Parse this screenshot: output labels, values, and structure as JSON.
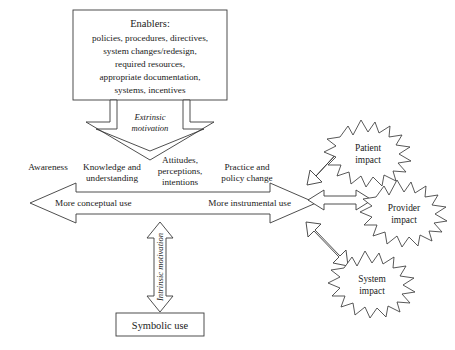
{
  "diagram": {
    "background_color": "#ffffff",
    "line_color": "#3b3b3b",
    "text_color": "#1a1a1a"
  },
  "enablers_box": {
    "heading": "Enablers:",
    "lines": [
      "policies, procedures, directives,",
      "system changes/redesign,",
      "required resources,",
      "appropriate documentation,",
      "systems, incentives"
    ]
  },
  "extrinsic_arrow": {
    "line1": "Extrinsic",
    "line2": "motivation"
  },
  "continuum_labels": [
    {
      "key": "awareness",
      "lines": [
        "Awareness"
      ]
    },
    {
      "key": "knowledge",
      "lines": [
        "Knowledge and",
        "understanding"
      ]
    },
    {
      "key": "attitudes",
      "lines": [
        "Attitudes,",
        "perceptions,",
        "intentions"
      ]
    },
    {
      "key": "practice",
      "lines": [
        "Practice and",
        "policy change"
      ]
    }
  ],
  "continuum_arrow": {
    "left_label": "More conceptual use",
    "right_label": "More instrumental use"
  },
  "intrinsic_arrow": {
    "label": "Intrinsic motivation"
  },
  "symbolic_box": {
    "label": "Symbolic use"
  },
  "impact_stars": [
    {
      "key": "patient",
      "line1": "Patient",
      "line2": "impact"
    },
    {
      "key": "provider",
      "line1": "Provider",
      "line2": "impact"
    },
    {
      "key": "system",
      "line1": "System",
      "line2": "impact"
    }
  ]
}
